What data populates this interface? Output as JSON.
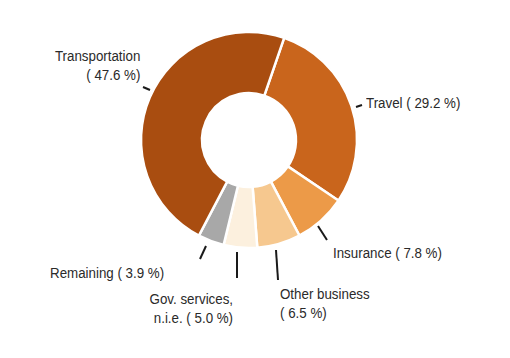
{
  "chart_data": {
    "type": "pie",
    "subtype": "donut",
    "title": "",
    "start_angle_deg": 19,
    "direction": "clockwise",
    "slices": [
      {
        "name": "Travel",
        "value": 29.2,
        "color": "#c9651c",
        "label_line1": "Travel ( 29.2 %)",
        "label_line2": ""
      },
      {
        "name": "Insurance",
        "value": 7.8,
        "color": "#ec9a48",
        "label_line1": "Insurance (  7.8 %)",
        "label_line2": ""
      },
      {
        "name": "Other business",
        "value": 6.5,
        "color": "#f6c88f",
        "label_line1": "Other business",
        "label_line2": "(  6.5 %)"
      },
      {
        "name": "Gov. services, n.i.e.",
        "value": 5.0,
        "color": "#fcf0de",
        "label_line1": "Gov. services,",
        "label_line2": "n.i.e. (  5.0 %)"
      },
      {
        "name": "Remaining",
        "value": 3.9,
        "color": "#a8a8a8",
        "label_line1": "Remaining (  3.9 %)",
        "label_line2": ""
      },
      {
        "name": "Transportation",
        "value": 47.6,
        "color": "#a94d10",
        "label_line1": "Transportation",
        "label_line2": "( 47.6 %)"
      }
    ],
    "legend": "none (direct labels)"
  },
  "labels": {
    "transportation_1": "Transportation",
    "transportation_2": "( 47.6 %)",
    "travel": "Travel ( 29.2 %)",
    "insurance": "Insurance (  7.8 %)",
    "other_1": "Other business",
    "other_2": "(  6.5 %)",
    "gov_1": "Gov. services,",
    "gov_2": "n.i.e. (  5.0 %)",
    "remaining": "Remaining (  3.9 %)"
  }
}
